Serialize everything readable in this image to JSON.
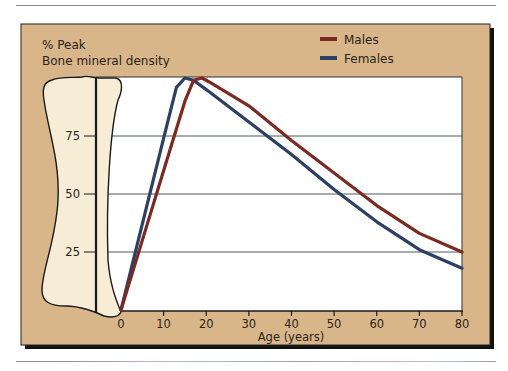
{
  "chart_data": {
    "type": "line",
    "title": "",
    "ylabel_lines": [
      "% Peak",
      "Bone mineral density"
    ],
    "xlabel": "Age (years)",
    "xlim": [
      0,
      80
    ],
    "ylim": [
      0,
      100
    ],
    "xticks": [
      0,
      10,
      20,
      30,
      40,
      50,
      60,
      70,
      80
    ],
    "yticks": [
      25,
      50,
      75
    ],
    "grid": "horizontal at 25, 50, 75",
    "legend_position": "top-right",
    "series": [
      {
        "name": "Males",
        "color": "#7a2a22",
        "points": [
          [
            0,
            0
          ],
          [
            5,
            30
          ],
          [
            10,
            60
          ],
          [
            15,
            90
          ],
          [
            17,
            99
          ],
          [
            19,
            100
          ],
          [
            21,
            98
          ],
          [
            30,
            88
          ],
          [
            40,
            73
          ],
          [
            50,
            59
          ],
          [
            60,
            45
          ],
          [
            70,
            33
          ],
          [
            80,
            25
          ]
        ]
      },
      {
        "name": "Females",
        "color": "#2d3f63",
        "points": [
          [
            0,
            0
          ],
          [
            5,
            37
          ],
          [
            10,
            74
          ],
          [
            13,
            96
          ],
          [
            15,
            100
          ],
          [
            17,
            99
          ],
          [
            20,
            95
          ],
          [
            30,
            81
          ],
          [
            40,
            67
          ],
          [
            50,
            52
          ],
          [
            60,
            38
          ],
          [
            70,
            26
          ],
          [
            80,
            18
          ]
        ]
      }
    ]
  },
  "colors": {
    "frame_bg": "#d9b68a",
    "plot_bg": "#ffffff",
    "bone_fill": "#f7ecd6",
    "ink": "#1a1a1a",
    "grid": "#4f5a55"
  }
}
